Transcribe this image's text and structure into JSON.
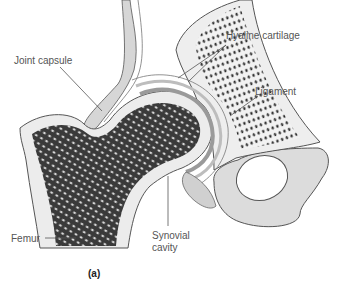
{
  "figure": {
    "caption": "(a)",
    "colors": {
      "background": "#ffffff",
      "bone_outline": "#555555",
      "spongy_bone": "#2a2a2a",
      "cartilage": "#e6e6e6",
      "pelvis_shade": "#d9d9d9",
      "leader_line": "#555555",
      "label_text": "#555555"
    }
  },
  "labels": [
    {
      "id": "joint-capsule",
      "text": "Joint capsule"
    },
    {
      "id": "hyaline-cartilage",
      "text": "Hyaline cartilage"
    },
    {
      "id": "ligament",
      "text": "Ligament"
    },
    {
      "id": "femur",
      "text": "Femur"
    },
    {
      "id": "synovial-cavity-line1",
      "text": "Synovial"
    },
    {
      "id": "synovial-cavity-line2",
      "text": "cavity"
    }
  ]
}
